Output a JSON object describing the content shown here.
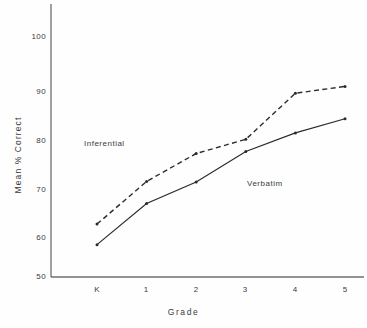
{
  "chart_data": {
    "type": "line",
    "title": "",
    "xlabel": "Grade",
    "ylabel": "Mean % Correct",
    "categories": [
      "K",
      "1",
      "2",
      "3",
      "4",
      "5"
    ],
    "ylim": [
      50,
      100
    ],
    "yticks": [
      50,
      60,
      70,
      80,
      90,
      100
    ],
    "grid": false,
    "legend_position": "inline-annotation",
    "series": [
      {
        "name": "Inferential",
        "style": "dashed",
        "color": "#2b2b2b",
        "values": [
          60.8,
          69.5,
          75.2,
          78.1,
          87.5,
          88.9
        ]
      },
      {
        "name": "Verbatim",
        "style": "solid",
        "color": "#2b2b2b",
        "values": [
          56.6,
          65.0,
          69.4,
          75.6,
          79.4,
          82.3
        ]
      }
    ],
    "annotations": [
      {
        "text": "Inferential",
        "series": "Inferential"
      },
      {
        "text": "Verbatim",
        "series": "Verbatim"
      }
    ]
  },
  "axis": {
    "y_label": "Mean % Correct",
    "x_label": "Grade",
    "y_tick_labels": [
      "100",
      "90",
      "80",
      "70",
      "60",
      "50"
    ],
    "x_tick_labels": [
      "K",
      "1",
      "2",
      "3",
      "4",
      "5"
    ]
  },
  "annotations": {
    "inferential": "Inferential",
    "verbatim": "Verbatim"
  },
  "colors": {
    "ink": "#2b2b2b",
    "axis": "#6e6e6e",
    "background": "#fefefe"
  }
}
